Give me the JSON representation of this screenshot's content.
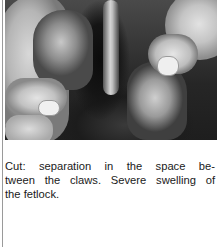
{
  "figure": {
    "photo_description": "Black-and-white photograph of hands spreading the two claws of a hoof, showing a cut in the interdigital space",
    "caption_lines": [
      "Cut: separation in the space be-",
      "tween the claws. Severe swelling of",
      "the fetlock."
    ],
    "caption_full": "Cut: separation in the space between the claws. Severe swelling of the fetlock."
  },
  "colors": {
    "page_background": "#ffffff",
    "text": "#1a1a1a",
    "rule": "#9a9a9a"
  }
}
